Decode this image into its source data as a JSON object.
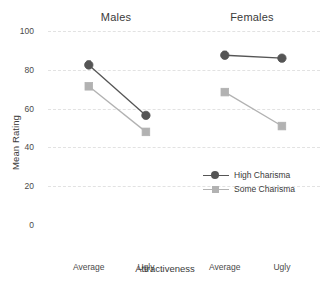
{
  "chart_data": {
    "type": "line",
    "title": "",
    "xlabel": "Attractiveness",
    "ylabel": "Mean Rating",
    "ylim": [
      0,
      100
    ],
    "yticks": [
      0,
      20,
      40,
      60,
      80,
      100
    ],
    "ytick_labels": [
      "0",
      "20",
      "40",
      "60",
      "80",
      "100"
    ],
    "grid": "horizontal-dashed",
    "legend_position": "inside-right-middle",
    "panels": [
      {
        "title": "Males",
        "categories": [
          "Average",
          "Ugly"
        ],
        "series": [
          {
            "name": "High Charisma",
            "values": [
              82.5,
              56.5
            ],
            "errors": [
              2.0,
              1.5
            ]
          },
          {
            "name": "Some Charisma",
            "values": [
              71.5,
              48.0
            ],
            "errors": [
              1.5,
              1.5
            ]
          }
        ]
      },
      {
        "title": "Females",
        "categories": [
          "Average",
          "Ugly"
        ],
        "series": [
          {
            "name": "High Charisma",
            "values": [
              87.5,
              86.0
            ],
            "errors": [
              2.0,
              1.0
            ]
          },
          {
            "name": "Some Charisma",
            "values": [
              68.5,
              51.0
            ],
            "errors": [
              1.5,
              1.5
            ]
          }
        ]
      }
    ],
    "legend": [
      {
        "label": "High Charisma",
        "marker": "circle",
        "color": "#555555"
      },
      {
        "label": "Some Charisma",
        "marker": "square",
        "color": "#b2b2b2"
      }
    ],
    "colors": {
      "high_charisma": "#555555",
      "some_charisma": "#b2b2b2",
      "grid": "#e2e2e2",
      "text": "#3a3a3a",
      "background": "#ffffff"
    }
  }
}
